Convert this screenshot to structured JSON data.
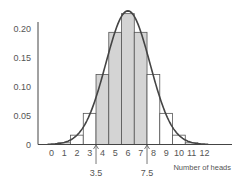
{
  "chart_data": {
    "type": "bar",
    "title": "",
    "xlabel": "Number of heads",
    "ylabel": "",
    "categories": [
      "0",
      "1",
      "2",
      "3",
      "4",
      "5",
      "6",
      "7",
      "8",
      "9",
      "10",
      "11",
      "12"
    ],
    "values": [
      0.0002,
      0.0029,
      0.0161,
      0.0537,
      0.1208,
      0.1934,
      0.2256,
      0.1934,
      0.1208,
      0.0537,
      0.0161,
      0.0029,
      0.0002
    ],
    "shaded_range": [
      4,
      7
    ],
    "y_ticks": [
      "0",
      "0.05",
      "0.10",
      "0.15",
      "0.20"
    ],
    "y_tick_values": [
      0,
      0.05,
      0.1,
      0.15,
      0.2
    ],
    "ylim": [
      0,
      0.23
    ],
    "xlim": [
      -0.5,
      14.5
    ],
    "overlay": {
      "type": "normal_curve",
      "mean": 6,
      "sd": 1.732
    },
    "annotations": [
      {
        "label": "3.5",
        "x": 3.5,
        "arrow": "up"
      },
      {
        "label": "7.5",
        "x": 7.5,
        "arrow": "up"
      }
    ],
    "grid": false,
    "legend": "none",
    "colors": {
      "shaded": "#d4d4d4",
      "unshaded": "#ffffff",
      "bar_edge": "#555555",
      "curve": "#444444",
      "axis": "#444444"
    }
  }
}
